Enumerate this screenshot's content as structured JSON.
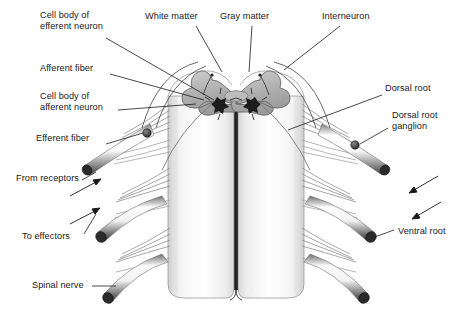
{
  "figure": {
    "kind": "anatomical-illustration",
    "style": "grayscale pen-and-ink shaded drawing",
    "background_color": "#ffffff",
    "line_color": "#1a1a1a",
    "gray_matter_color": "#b4b4b4",
    "white_matter_color": "#f2f2f2",
    "fissure_color": "#222222"
  },
  "labels": [
    {
      "id": "cell-body-efferent",
      "text": "Cell body of\nefferent neuron",
      "x": 40,
      "y": 10,
      "align": "left"
    },
    {
      "id": "white-matter",
      "text": "White matter",
      "x": 145,
      "y": 11,
      "align": "left"
    },
    {
      "id": "gray-matter",
      "text": "Gray matter",
      "x": 220,
      "y": 11,
      "align": "left"
    },
    {
      "id": "interneuron",
      "text": "Interneuron",
      "x": 322,
      "y": 11,
      "align": "left"
    },
    {
      "id": "afferent-fiber",
      "text": "Afferent fiber",
      "x": 40,
      "y": 63,
      "align": "left"
    },
    {
      "id": "cell-body-afferent",
      "text": "Cell body of\nafferent neuron",
      "x": 40,
      "y": 91,
      "align": "left"
    },
    {
      "id": "dorsal-root",
      "text": "Dorsal root",
      "x": 385,
      "y": 83,
      "align": "left"
    },
    {
      "id": "dorsal-root-ganglion",
      "text": "Dorsal root\nganglion",
      "x": 392,
      "y": 110,
      "align": "left"
    },
    {
      "id": "efferent-fiber",
      "text": "Efferent fiber",
      "x": 36,
      "y": 133,
      "align": "left"
    },
    {
      "id": "from-receptors",
      "text": "From receptors",
      "x": 16,
      "y": 173,
      "align": "left"
    },
    {
      "id": "to-effectors",
      "text": "To effectors",
      "x": 22,
      "y": 231,
      "align": "left"
    },
    {
      "id": "ventral-root",
      "text": "Ventral root",
      "x": 398,
      "y": 226,
      "align": "left"
    },
    {
      "id": "spinal-nerve",
      "text": "Spinal nerve",
      "x": 32,
      "y": 280,
      "align": "left"
    }
  ],
  "structures": {
    "cord_columns": 2,
    "nerve_pairs": 3,
    "ganglion_markers": 2,
    "neuron_cell_bodies": 2,
    "direction_arrows": 4
  }
}
